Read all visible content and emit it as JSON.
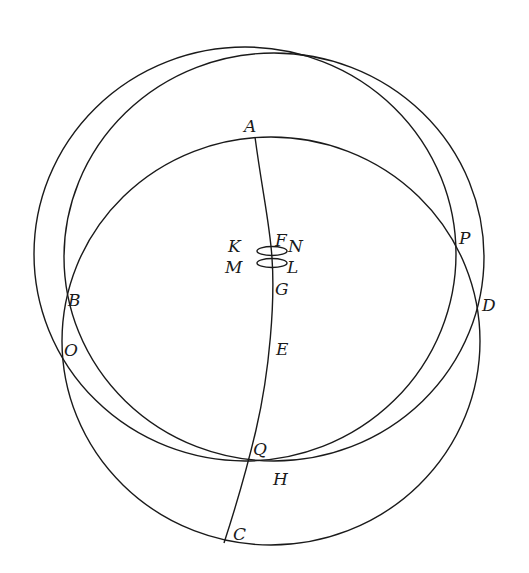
{
  "diagram": {
    "type": "geometric-figure",
    "stroke_color": "#1a1a1a",
    "background": "#ffffff",
    "circles": [
      {
        "name": "outer-upper-circle",
        "cx": 245,
        "cy": 254,
        "rx": 211,
        "ry": 207
      },
      {
        "name": "inner-upper-circle",
        "cx": 274,
        "cy": 257,
        "rx": 210,
        "ry": 204
      },
      {
        "name": "lower-circle",
        "cx": 271,
        "cy": 341,
        "rx": 209,
        "ry": 204
      }
    ],
    "small_ellipses": [
      {
        "name": "ellipse-kn",
        "cx": 272,
        "cy": 251,
        "rx": 15,
        "ry": 4.5
      },
      {
        "name": "ellipse-ml",
        "cx": 272,
        "cy": 263,
        "rx": 15,
        "ry": 4.5
      }
    ],
    "meridian_path": "M255,137 C262,190 270,225 272,258 C275,300 270,370 256,430 C249,460 238,500 224,543",
    "labels": [
      {
        "text": "A",
        "x": 244,
        "y": 132
      },
      {
        "text": "K",
        "x": 228,
        "y": 252
      },
      {
        "text": "F",
        "x": 275,
        "y": 246
      },
      {
        "text": "N",
        "x": 288,
        "y": 252
      },
      {
        "text": "M",
        "x": 225,
        "y": 273
      },
      {
        "text": "L",
        "x": 287,
        "y": 273
      },
      {
        "text": "G",
        "x": 275,
        "y": 295
      },
      {
        "text": "P",
        "x": 459,
        "y": 244
      },
      {
        "text": "B",
        "x": 68,
        "y": 306
      },
      {
        "text": "D",
        "x": 482,
        "y": 311
      },
      {
        "text": "O",
        "x": 64,
        "y": 356
      },
      {
        "text": "E",
        "x": 276,
        "y": 355
      },
      {
        "text": "Q",
        "x": 253,
        "y": 455
      },
      {
        "text": "H",
        "x": 273,
        "y": 485
      },
      {
        "text": "C",
        "x": 233,
        "y": 540
      }
    ]
  }
}
